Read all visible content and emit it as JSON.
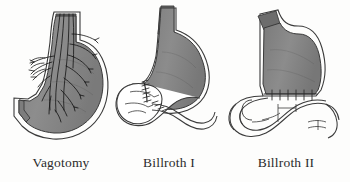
{
  "figure": {
    "background_color": "#fdfdfc",
    "width": 350,
    "height": 182
  },
  "palette": {
    "stomach_fill": "#8a8a8a",
    "stomach_fill_dark": "#6d6d6d",
    "esophagus_fill": "#6a6a6a",
    "outline": "#2f2f2f",
    "nerve_color": "#1a1a1a",
    "caption_color": "#2b2b2b",
    "bowel_fill": "#ffffff"
  },
  "panels": [
    {
      "id": "vagotomy",
      "caption": "Vagotomy",
      "parts": [
        "esophagus",
        "stomach-body",
        "vagus-nerve-trunk",
        "vagus-nerve-branches",
        "duodenum-stump"
      ]
    },
    {
      "id": "billroth1",
      "caption": "Billroth I",
      "parts": [
        "esophagus",
        "stomach-remnant",
        "gastroduodenal-anastomosis",
        "suture-line",
        "duodenum-loop"
      ]
    },
    {
      "id": "billroth2",
      "caption": "Billroth II",
      "parts": [
        "esophageal-stump",
        "stomach-remnant",
        "gastrojejunal-anastomosis",
        "suture-line",
        "jejunal-loop",
        "duodenal-stump"
      ]
    }
  ]
}
